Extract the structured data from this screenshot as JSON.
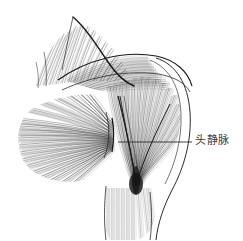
{
  "figure": {
    "background_color": "#ffffff",
    "ink_color": "#2b2b2b",
    "style": "pen-and-ink hatched anatomical illustration"
  },
  "annotations": [
    {
      "id": "cephalic-vein",
      "label": "头静脉",
      "leader_line": {
        "x1": 118,
        "y1": 142,
        "x2": 192,
        "y2": 142,
        "color": "#2b2b2b"
      },
      "text_position": {
        "x": 195,
        "y": 134
      }
    }
  ],
  "structures": [
    {
      "name": "deltoid",
      "region": "central-upper",
      "shading": "converging-fibers"
    },
    {
      "name": "pectoralis-major",
      "region": "left-fan",
      "shading": "radiating-hatch"
    },
    {
      "name": "trapezius",
      "region": "top-left",
      "shading": "fine-hatch"
    },
    {
      "name": "upper-arm",
      "region": "bottom-center",
      "shading": "vertical-hatch"
    },
    {
      "name": "shoulder-contour",
      "region": "right-edge",
      "shading": "outline"
    }
  ]
}
